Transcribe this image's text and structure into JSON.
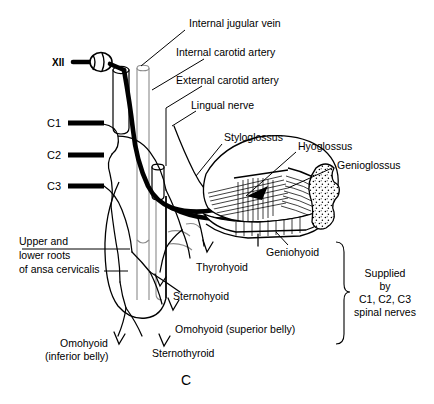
{
  "figure": {
    "panel_letter": "C",
    "title_labels": {
      "internal_jugular_vein": "Internal jugular vein",
      "internal_carotid_artery": "Internal carotid artery",
      "external_carotid_artery": "External carotid artery",
      "lingual_nerve": "Lingual nerve"
    },
    "nerve_root_labels": {
      "cn12": "XII",
      "c1": "C1",
      "c2": "C2",
      "c3": "C3"
    },
    "muscle_labels": {
      "styloglossus": "Styloglossus",
      "hyoglossus": "Hyoglossus",
      "genioglossus": "Genioglossus",
      "geniohyoid": "Geniohyoid",
      "thyrohyoid": "Thyrohyoid",
      "sternohyoid": "Sternohyoid",
      "omohyoid_superior": "Omohyoid (superior belly)",
      "sternothyroid": "Sternothyroid",
      "omohyoid_inferior_line1": "Omohyoid",
      "omohyoid_inferior_line2": "(inferior belly)"
    },
    "ansa_label": {
      "line1": "Upper and",
      "line2": "lower roots",
      "line3": "of ansa cervicalis"
    },
    "brace_note": {
      "line1": "Supplied",
      "line2": "by",
      "line3": "C1, C2, C3",
      "line4": "spinal nerves"
    },
    "colors": {
      "ink": "#000000",
      "background": "#ffffff",
      "vessel_grey": "#8a8a8a"
    }
  }
}
